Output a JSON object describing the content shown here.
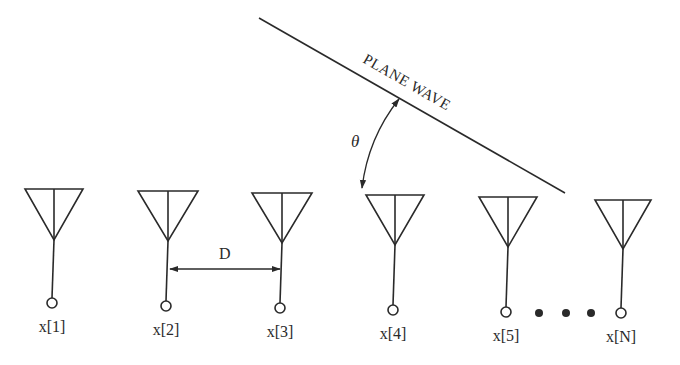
{
  "diagram": {
    "plane_wave": {
      "label": "PLANE WAVE",
      "start": [
        259,
        18
      ],
      "end": [
        565,
        193
      ]
    },
    "angle": {
      "label": "θ",
      "arc_start": [
        399,
        98
      ],
      "arc_end": [
        362,
        188
      ]
    },
    "spacing": {
      "label": "D",
      "from_element": "x[2]",
      "to_element": "x[3]"
    },
    "ellipsis": "• • •",
    "elements": [
      {
        "label": "x[1]",
        "cx": 54,
        "top": 189,
        "half_width": 29,
        "apex_y": 240,
        "node_y": 303
      },
      {
        "label": "x[2]",
        "cx": 168,
        "top": 191,
        "half_width": 30,
        "apex_y": 241,
        "node_y": 306
      },
      {
        "label": "x[3]",
        "cx": 282,
        "top": 193,
        "half_width": 30,
        "apex_y": 243,
        "node_y": 308
      },
      {
        "label": "x[4]",
        "cx": 395,
        "top": 195,
        "half_width": 29,
        "apex_y": 245,
        "node_y": 310
      },
      {
        "label": "x[5]",
        "cx": 508,
        "top": 197,
        "half_width": 29,
        "apex_y": 247,
        "node_y": 312
      },
      {
        "label": "x[N]",
        "cx": 623,
        "top": 200,
        "half_width": 28,
        "apex_y": 249,
        "node_y": 313
      }
    ]
  }
}
